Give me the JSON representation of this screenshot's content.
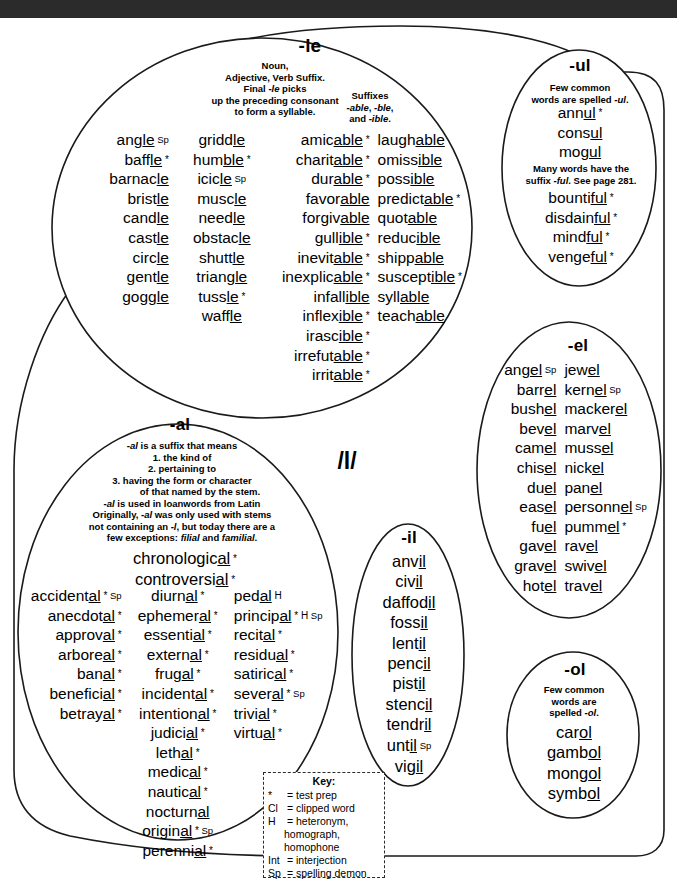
{
  "phoneme": "/l/",
  "groups": {
    "le": {
      "title": "-le",
      "note1": "Noun,\nAdjective, Verb Suffix.\nFinal -le picks\nup the preceding consonant\nto form a syllable.",
      "note2": "Suffixes\n-able, -ble,\nand -ible.",
      "col1": [
        "angle Sp",
        "baffle *",
        "barnacle",
        "bristle",
        "candle",
        "castle",
        "circle",
        "gentle",
        "goggle"
      ],
      "col2": [
        "griddle",
        "humble *",
        "icicle Sp",
        "muscle",
        "needle",
        "obstacle",
        "shuttle",
        "triangle",
        "tussle *",
        "waffle"
      ],
      "col3": [
        "amicable *",
        "charitable *",
        "durable *",
        "favorable",
        "forgivable",
        "gullible *",
        "inevitable *",
        "inexplicable *",
        "infallible",
        "inflexible *",
        "irascible *",
        "irrefutable *",
        "irritable *"
      ],
      "col4": [
        "laughable",
        "omissible",
        "possible",
        "predictable *",
        "quotable",
        "reducible",
        "shippable",
        "susceptible *",
        "syllable",
        "teachable"
      ]
    },
    "ul": {
      "title": "-ul",
      "note1": "Few common\nwords are spelled -ul.",
      "list1": [
        "annul *",
        "consul",
        "mogul"
      ],
      "note2": "Many words have the\nsuffix -ful.  See page 281.",
      "list2": [
        "bountiful *",
        "disdainful *",
        "mindful *",
        "vengeful *"
      ]
    },
    "el": {
      "title": "-el",
      "col1": [
        "angel Sp",
        "barrel",
        "bushel",
        "bevel",
        "camel",
        "chisel",
        "duel",
        "easel",
        "fuel",
        "gavel",
        "gravel",
        "hotel"
      ],
      "col2": [
        "jewel",
        "kernel Sp",
        "mackerel",
        "marvel",
        "mussel",
        "nickel",
        "panel",
        "personnel Sp",
        "pummel *",
        "ravel",
        "swivel",
        "travel"
      ]
    },
    "ol": {
      "title": "-ol",
      "note": "Few common\nwords are\nspelled -ol.",
      "list": [
        "carol",
        "gambol",
        "mongol",
        "symbol"
      ]
    },
    "il": {
      "title": "-il",
      "list": [
        "anvil",
        "civil",
        "daffodil",
        "fossil",
        "lentil",
        "pencil",
        "pistil",
        "stencil",
        "tendril",
        "until Sp",
        "vigil"
      ]
    },
    "al": {
      "title": "-al",
      "note_lead": "-al is a suffix that means",
      "note_items": [
        "1. the kind of",
        "2. pertaining to",
        "3. having the form or character",
        "of that named by the stem."
      ],
      "note_tail": "-al is used in loanwords from Latin\nOriginally, -al was only used with stems\nnot containing an -l, but today there are a\nfew exceptions: filial and familial.",
      "top": [
        "chronological *",
        "controversial *"
      ],
      "col1": [
        "accidental * Sp",
        "anecdotal *",
        "approval *",
        "arboreal *",
        "banal *",
        "beneficial *",
        "betrayal *"
      ],
      "col2": [
        "diurnal *",
        "ephemeral *",
        "essential *",
        "external *",
        "frugal *",
        "incidental *",
        "intentional *",
        "judicial *",
        "lethal *",
        "medical *",
        "nautical *",
        "nocturnal",
        "original * Sp",
        "perennial *"
      ],
      "col3": [
        "pedal H",
        "principal * H Sp",
        "recital *",
        "residual *",
        "satirical *",
        "several * Sp",
        "trivial *",
        "virtual *"
      ]
    }
  },
  "key": {
    "title": "Key:",
    "rows": [
      {
        "sym": "*",
        "def": "test prep"
      },
      {
        "sym": "Cl",
        "def": "clipped word"
      },
      {
        "sym": "H",
        "def": "heteronym,"
      },
      {
        "sym": "",
        "def": "homograph,",
        "indent": true
      },
      {
        "sym": "",
        "def": "homophone",
        "indent": true
      },
      {
        "sym": "Int",
        "def": "interjection"
      },
      {
        "sym": "Sp",
        "def": "spelling demon"
      }
    ]
  }
}
